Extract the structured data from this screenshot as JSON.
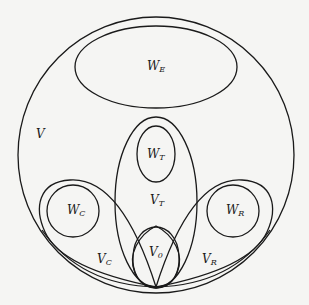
{
  "diagram": {
    "type": "set-region-diagram",
    "stroke_color": "#1a1a1a",
    "background": "#f5f5f3",
    "regions": [
      {
        "id": "V",
        "base": "V",
        "sub": "",
        "shape": "circle",
        "label_pos": [
          36,
          135
        ]
      },
      {
        "id": "W_E",
        "base": "W",
        "sub": "E",
        "shape": "ellipse",
        "label_pos": [
          148,
          63
        ]
      },
      {
        "id": "W_T",
        "base": "W",
        "sub": "T",
        "shape": "ellipse",
        "label_pos": [
          148,
          152
        ]
      },
      {
        "id": "V_T",
        "base": "V",
        "sub": "T",
        "shape": "ellipse",
        "label_pos": [
          150,
          199
        ]
      },
      {
        "id": "W_C",
        "base": "W",
        "sub": "C",
        "shape": "circle",
        "label_pos": [
          70,
          208
        ]
      },
      {
        "id": "W_R",
        "base": "W",
        "sub": "R",
        "shape": "circle",
        "label_pos": [
          227,
          208
        ]
      },
      {
        "id": "V_0",
        "base": "V",
        "sub": "0",
        "shape": "ellipse",
        "label_pos": [
          150,
          251
        ]
      },
      {
        "id": "V_C",
        "base": "V",
        "sub": "C",
        "shape": "loop",
        "label_pos": [
          98,
          256
        ]
      },
      {
        "id": "V_R",
        "base": "V",
        "sub": "R",
        "shape": "loop",
        "label_pos": [
          203,
          256
        ]
      }
    ]
  }
}
